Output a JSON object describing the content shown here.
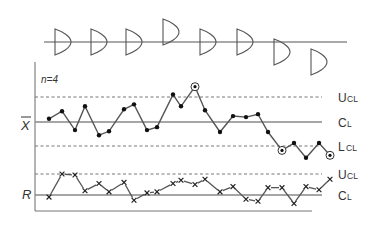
{
  "chart_data": {
    "type": "line",
    "title": "",
    "subtitle": "Xbar-R control chart with process distribution shifts",
    "sample_size_label": "n=4",
    "distribution_row": {
      "description": "Process distributions per subgroup relative to center line",
      "offsets": [
        0,
        0,
        0,
        -1,
        0,
        0,
        1,
        2
      ]
    },
    "xbar_chart": {
      "ylabel": "X̄",
      "limits": {
        "UCL": "UCL",
        "CL": "CL",
        "LCL": "LCL"
      },
      "points": [
        {
          "x": 1,
          "y": 0.13
        },
        {
          "x": 2,
          "y": 0.44
        },
        {
          "x": 3,
          "y": -0.33
        },
        {
          "x": 4,
          "y": 0.64
        },
        {
          "x": 5,
          "y": -0.54
        },
        {
          "x": 6,
          "y": -0.38
        },
        {
          "x": 7,
          "y": 0.52
        },
        {
          "x": 8,
          "y": 0.72
        },
        {
          "x": 9,
          "y": -0.33
        },
        {
          "x": 10,
          "y": -0.21
        },
        {
          "x": 11,
          "y": 1.12
        },
        {
          "x": 12,
          "y": 0.64
        },
        {
          "x": 13,
          "y": 1.44,
          "out_of_control": true
        },
        {
          "x": 14,
          "y": 0.48
        },
        {
          "x": 15,
          "y": -0.41
        },
        {
          "x": 16,
          "y": 0.24
        },
        {
          "x": 17,
          "y": 0.2
        },
        {
          "x": 18,
          "y": 0.32
        },
        {
          "x": 19,
          "y": -0.41
        },
        {
          "x": 20,
          "y": -1.16,
          "out_of_control": true
        },
        {
          "x": 21,
          "y": -0.86
        },
        {
          "x": 22,
          "y": -1.46
        },
        {
          "x": 23,
          "y": -0.86
        },
        {
          "x": 24,
          "y": -1.36,
          "out_of_control": true
        }
      ],
      "ylim": [
        -1.8,
        1.8
      ]
    },
    "r_chart": {
      "ylabel": "R",
      "limits": {
        "UCL": "UCL",
        "CL": "CL"
      },
      "points": [
        {
          "x": 1,
          "y": -0.1
        },
        {
          "x": 2,
          "y": 1.0
        },
        {
          "x": 3,
          "y": 0.95
        },
        {
          "x": 4,
          "y": 0.2
        },
        {
          "x": 5,
          "y": 0.55
        },
        {
          "x": 6,
          "y": 0.15
        },
        {
          "x": 7,
          "y": 0.6
        },
        {
          "x": 8,
          "y": -0.25
        },
        {
          "x": 9,
          "y": 0.1
        },
        {
          "x": 10,
          "y": 0.15
        },
        {
          "x": 11,
          "y": 0.55
        },
        {
          "x": 12,
          "y": 0.7
        },
        {
          "x": 13,
          "y": 0.5
        },
        {
          "x": 14,
          "y": 0.75
        },
        {
          "x": 15,
          "y": 0.15
        },
        {
          "x": 16,
          "y": 0.4
        },
        {
          "x": 17,
          "y": -0.2
        },
        {
          "x": 18,
          "y": -0.3
        },
        {
          "x": 19,
          "y": 0.35
        },
        {
          "x": 20,
          "y": 0.35
        },
        {
          "x": 21,
          "y": -0.4
        },
        {
          "x": 22,
          "y": 0.4
        },
        {
          "x": 23,
          "y": 0.25
        },
        {
          "x": 24,
          "y": 0.75
        }
      ]
    }
  },
  "labels": {
    "n": "n=4",
    "xbar": "X",
    "r": "R",
    "ucl_u": "U",
    "ucl_cl": "CL",
    "cl_c": "C",
    "cl_l": "L",
    "lcl_l": "L",
    "lcl_cl": "CL",
    "r_ucl_u": "U",
    "r_ucl_cl": "CL",
    "r_cl_c": "C",
    "r_cl_l": "L"
  },
  "colors": {
    "line": "#555555",
    "point": "#111111",
    "axis": "#777777",
    "dashed": "#777777"
  }
}
